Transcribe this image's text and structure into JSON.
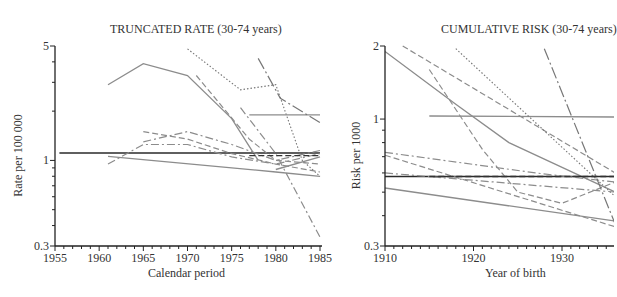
{
  "chart_data": [
    {
      "type": "line",
      "title": "TRUNCATED RATE (30-74 years)",
      "xlabel": "Calendar period",
      "ylabel": "Rate per 100 000",
      "xlim": [
        1955,
        1985
      ],
      "ylim": [
        0.3,
        5
      ],
      "yscale": "log",
      "xticks": [
        "1955",
        "1960",
        "1965",
        "1970",
        "1975",
        "1980",
        "1985"
      ],
      "yticks": [
        "0.3",
        "1",
        "5"
      ],
      "grid": false,
      "series": [
        {
          "name": "s1",
          "style": "solid",
          "x": [
            1961,
            1965,
            1970,
            1975,
            1978
          ],
          "y": [
            2.9,
            3.9,
            3.3,
            1.8,
            1.0
          ]
        },
        {
          "name": "s2",
          "style": "solid-dark",
          "x": [
            1955.5,
            1985
          ],
          "y": [
            1.11,
            1.11
          ]
        },
        {
          "name": "s3",
          "style": "solid",
          "x": [
            1961,
            1980,
            1985
          ],
          "y": [
            1.06,
            0.85,
            0.8
          ]
        },
        {
          "name": "s4",
          "style": "dashdot",
          "x": [
            1961,
            1965,
            1970,
            1975,
            1980,
            1985
          ],
          "y": [
            0.95,
            1.25,
            1.25,
            1.05,
            0.95,
            1.1
          ]
        },
        {
          "name": "s5",
          "style": "dashdot",
          "x": [
            1965,
            1970,
            1975,
            1980,
            1985
          ],
          "y": [
            1.3,
            1.5,
            1.25,
            1.0,
            1.15
          ]
        },
        {
          "name": "s6",
          "style": "dashed",
          "x": [
            1965,
            1970,
            1975,
            1980,
            1985
          ],
          "y": [
            1.5,
            1.35,
            1.1,
            0.95,
            0.85
          ]
        },
        {
          "name": "s7",
          "style": "dotted",
          "x": [
            1970,
            1976,
            1980,
            1983,
            1985
          ],
          "y": [
            4.8,
            2.7,
            2.9,
            1.0,
            0.8
          ]
        },
        {
          "name": "s8",
          "style": "dashed",
          "x": [
            1971,
            1977,
            1980,
            1985
          ],
          "y": [
            3.3,
            1.35,
            1.0,
            0.95
          ]
        },
        {
          "name": "s9",
          "style": "solid",
          "x": [
            1977,
            1985
          ],
          "y": [
            1.9,
            1.9
          ]
        },
        {
          "name": "s10",
          "style": "longdash",
          "x": [
            1978,
            1980.5,
            1985
          ],
          "y": [
            4.2,
            2.4,
            1.7
          ]
        },
        {
          "name": "s11",
          "style": "dashdot",
          "x": [
            1976,
            1980,
            1985
          ],
          "y": [
            2.1,
            1.1,
            0.34
          ]
        },
        {
          "name": "s12",
          "style": "dashed-dark",
          "x": [
            1977,
            1985
          ],
          "y": [
            1.07,
            1.07
          ]
        },
        {
          "name": "s13",
          "style": "solid",
          "x": [
            1980,
            1985
          ],
          "y": [
            0.88,
            1.05
          ]
        }
      ]
    },
    {
      "type": "line",
      "title": "CUMULATIVE RISK (30-74 years)",
      "xlabel": "Year of birth",
      "ylabel": "Risk per 1000",
      "xlim": [
        1910,
        1936
      ],
      "ylim": [
        0.3,
        2
      ],
      "yscale": "log",
      "xticks": [
        "1910",
        "1920",
        "1930"
      ],
      "yticks": [
        "0.3",
        "1",
        "2"
      ],
      "grid": false,
      "series": [
        {
          "name": "r1",
          "style": "solid",
          "x": [
            1910,
            1918,
            1924,
            1936
          ],
          "y": [
            1.9,
            1.15,
            0.8,
            0.5
          ]
        },
        {
          "name": "r2",
          "style": "solid-dark",
          "x": [
            1910,
            1936
          ],
          "y": [
            0.58,
            0.58
          ]
        },
        {
          "name": "r3",
          "style": "solid",
          "x": [
            1910,
            1936
          ],
          "y": [
            0.52,
            0.38
          ]
        },
        {
          "name": "r4",
          "style": "solid",
          "x": [
            1915,
            1936
          ],
          "y": [
            1.03,
            1.02
          ]
        },
        {
          "name": "r5",
          "style": "dashed",
          "x": [
            1912,
            1936
          ],
          "y": [
            2.0,
            0.6
          ]
        },
        {
          "name": "r6",
          "style": "dashed",
          "x": [
            1915,
            1921,
            1925,
            1930,
            1936
          ],
          "y": [
            1.6,
            0.75,
            0.5,
            0.45,
            0.55
          ]
        },
        {
          "name": "r7",
          "style": "dotted",
          "x": [
            1918,
            1936
          ],
          "y": [
            1.95,
            0.48
          ]
        },
        {
          "name": "r8",
          "style": "dashdot",
          "x": [
            1910,
            1927,
            1936
          ],
          "y": [
            0.73,
            0.6,
            0.55
          ]
        },
        {
          "name": "r9",
          "style": "dashdot",
          "x": [
            1910,
            1936
          ],
          "y": [
            0.6,
            0.5
          ]
        },
        {
          "name": "r10",
          "style": "dashed",
          "x": [
            1910,
            1936
          ],
          "y": [
            0.71,
            0.36
          ]
        },
        {
          "name": "r11",
          "style": "longdash",
          "x": [
            1928,
            1936
          ],
          "y": [
            1.95,
            0.37
          ]
        },
        {
          "name": "r12",
          "style": "dashed-dark",
          "x": [
            1915,
            1936
          ],
          "y": [
            0.58,
            0.58
          ]
        }
      ]
    }
  ],
  "left": {
    "title": "TRUNCATED RATE (30-74 years)",
    "xlabel": "Calendar period",
    "ylabel": "Rate per 100 000"
  },
  "right": {
    "title": "CUMULATIVE RISK (30-74 years)",
    "xlabel": "Year of birth",
    "ylabel": "Risk per 1000"
  }
}
